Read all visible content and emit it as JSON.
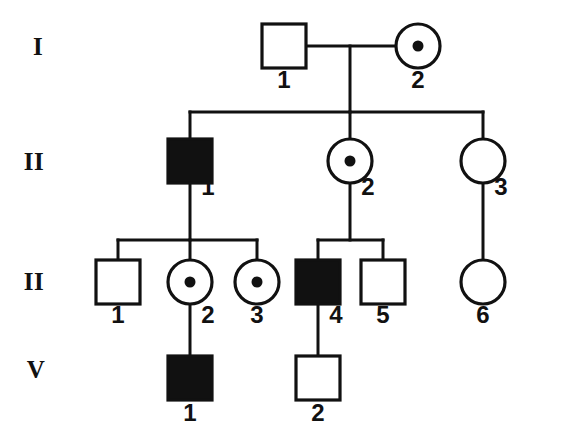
{
  "chart": {
    "type": "pedigree",
    "colors": {
      "stroke": "#111111",
      "affected_fill": "#111111",
      "unaffected_fill": "#ffffff",
      "background": "#ffffff"
    },
    "legend_semantics": {
      "square": "male",
      "circle": "female",
      "filled": "affected",
      "open": "unaffected",
      "center_dot": "carrier"
    }
  },
  "generations": [
    {
      "label": "I",
      "label_x": 38,
      "label_y": 55
    },
    {
      "label": "II",
      "label_x": 34,
      "label_y": 170
    },
    {
      "label": "II",
      "label_x": 34,
      "label_y": 290
    },
    {
      "label": "V",
      "label_x": 36,
      "label_y": 378
    }
  ],
  "individuals": [
    {
      "id": "I-1",
      "generation": "I",
      "number": "1",
      "sex": "male",
      "shape": "square",
      "status": "unaffected",
      "carrier": false,
      "cx": 284,
      "cy": 46,
      "size": 44,
      "num_x": 284,
      "num_y": 88
    },
    {
      "id": "I-2",
      "generation": "I",
      "number": "2",
      "sex": "female",
      "shape": "circle",
      "status": "unaffected",
      "carrier": true,
      "cx": 418,
      "cy": 46,
      "size": 44,
      "num_x": 418,
      "num_y": 88
    },
    {
      "id": "II-1",
      "generation": "II",
      "number": "1",
      "sex": "male",
      "shape": "square",
      "status": "affected",
      "carrier": false,
      "cx": 190,
      "cy": 161,
      "size": 44,
      "num_x": 208,
      "num_y": 195
    },
    {
      "id": "II-2",
      "generation": "II",
      "number": "2",
      "sex": "female",
      "shape": "circle",
      "status": "unaffected",
      "carrier": true,
      "cx": 350,
      "cy": 161,
      "size": 44,
      "num_x": 368,
      "num_y": 195
    },
    {
      "id": "II-3",
      "generation": "II",
      "number": "3",
      "sex": "female",
      "shape": "circle",
      "status": "unaffected",
      "carrier": false,
      "cx": 483,
      "cy": 161,
      "size": 44,
      "num_x": 501,
      "num_y": 195
    },
    {
      "id": "III-1",
      "generation": "II",
      "number": "1",
      "sex": "male",
      "shape": "square",
      "status": "unaffected",
      "carrier": false,
      "cx": 118,
      "cy": 282,
      "size": 44,
      "num_x": 118,
      "num_y": 323
    },
    {
      "id": "III-2",
      "generation": "II",
      "number": "2",
      "sex": "female",
      "shape": "circle",
      "status": "unaffected",
      "carrier": true,
      "cx": 190,
      "cy": 282,
      "size": 44,
      "num_x": 208,
      "num_y": 323
    },
    {
      "id": "III-3",
      "generation": "II",
      "number": "3",
      "sex": "female",
      "shape": "circle",
      "status": "unaffected",
      "carrier": true,
      "cx": 257,
      "cy": 282,
      "size": 44,
      "num_x": 257,
      "num_y": 323
    },
    {
      "id": "III-4",
      "generation": "II",
      "number": "4",
      "sex": "male",
      "shape": "square",
      "status": "affected",
      "carrier": false,
      "cx": 318,
      "cy": 282,
      "size": 44,
      "num_x": 336,
      "num_y": 323
    },
    {
      "id": "III-5",
      "generation": "II",
      "number": "5",
      "sex": "male",
      "shape": "square",
      "status": "unaffected",
      "carrier": false,
      "cx": 383,
      "cy": 282,
      "size": 44,
      "num_x": 383,
      "num_y": 323
    },
    {
      "id": "III-6",
      "generation": "II",
      "number": "6",
      "sex": "female",
      "shape": "circle",
      "status": "unaffected",
      "carrier": false,
      "cx": 483,
      "cy": 282,
      "size": 44,
      "num_x": 483,
      "num_y": 323
    },
    {
      "id": "IV-1",
      "generation": "V",
      "number": "1",
      "sex": "male",
      "shape": "square",
      "status": "affected",
      "carrier": false,
      "cx": 190,
      "cy": 378,
      "size": 44,
      "num_x": 190,
      "num_y": 421
    },
    {
      "id": "IV-2",
      "generation": "V",
      "number": "2",
      "sex": "male",
      "shape": "square",
      "status": "unaffected",
      "carrier": false,
      "cx": 318,
      "cy": 378,
      "size": 44,
      "num_x": 318,
      "num_y": 421
    }
  ],
  "connections": {
    "mating_I": {
      "x1": 306,
      "y1": 46,
      "x2": 396,
      "y2": 46
    },
    "descent_I": {
      "x": 350,
      "y1": 46,
      "y2": 112
    },
    "sibship_II": {
      "x1": 190,
      "x2": 483,
      "y": 112
    },
    "stems_II": [
      {
        "x": 190,
        "y1": 112,
        "y2": 139
      },
      {
        "x": 350,
        "y1": 112,
        "y2": 139
      },
      {
        "x": 483,
        "y1": 112,
        "y2": 139
      }
    ],
    "descent_II_1": {
      "x": 190,
      "y1": 183,
      "y2": 240
    },
    "descent_II_2": {
      "x": 350,
      "y1": 183,
      "y2": 240
    },
    "descent_II_3": {
      "x": 483,
      "y1": 183,
      "y2": 260
    },
    "sibship_III_left": {
      "x1": 118,
      "x2": 257,
      "y": 240
    },
    "stems_III_left": [
      {
        "x": 118,
        "y1": 240,
        "y2": 260
      },
      {
        "x": 190,
        "y1": 240,
        "y2": 260
      },
      {
        "x": 257,
        "y1": 240,
        "y2": 260
      }
    ],
    "sibship_III_right": {
      "x1": 318,
      "x2": 383,
      "y": 240
    },
    "stems_III_right": [
      {
        "x": 318,
        "y1": 240,
        "y2": 260
      },
      {
        "x": 383,
        "y1": 240,
        "y2": 260
      }
    ],
    "descent_III_2": {
      "x": 190,
      "y1": 304,
      "y2": 356
    },
    "descent_III_4": {
      "x": 318,
      "y1": 304,
      "y2": 356
    }
  }
}
